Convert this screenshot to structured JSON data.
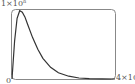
{
  "chart_data": {
    "type": "line",
    "title": "",
    "xlabel": "",
    "ylabel": "",
    "x_tick_labels": [
      "0",
      "4×10"
    ],
    "y_tick_labels": [
      "1×10^n"
    ],
    "xlim": [
      0,
      4
    ],
    "ylim": [
      0,
      1
    ],
    "grid": false,
    "legend": null,
    "series": [
      {
        "name": "curve",
        "x": [
          0,
          0.1,
          0.2,
          0.3,
          0.4,
          0.5,
          0.6,
          0.8,
          1.0,
          1.2,
          1.5,
          1.8,
          2.2,
          2.6,
          3.0,
          3.5,
          4.0
        ],
        "y": [
          0,
          0.55,
          0.88,
          0.99,
          0.97,
          0.9,
          0.8,
          0.6,
          0.43,
          0.3,
          0.17,
          0.09,
          0.04,
          0.015,
          0.005,
          0.001,
          0
        ]
      }
    ],
    "color": "#333333"
  },
  "labels": {
    "ymax": "1×10",
    "ymax_exp": "n",
    "xmin": "0",
    "xmax": "4×10"
  }
}
